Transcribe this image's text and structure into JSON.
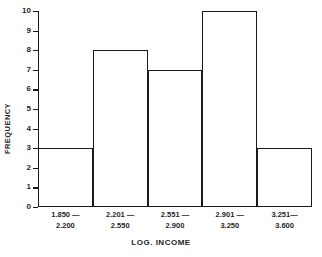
{
  "chart_data": {
    "type": "bar",
    "title": "",
    "xlabel": "LOG. INCOME",
    "ylabel": "FREQUENCY",
    "categories": [
      "1.850 —\n2.200",
      "2.201 —\n2.550",
      "2.551 —\n2.900",
      "2.901 —\n3.250",
      "3.251—\n3.600"
    ],
    "bins": [
      {
        "line1": "1.850 —",
        "line2": "2.200",
        "lower": 1.85,
        "upper": 2.2,
        "value": 3
      },
      {
        "line1": "2.201 —",
        "line2": "2.550",
        "lower": 2.201,
        "upper": 2.55,
        "value": 8
      },
      {
        "line1": "2.551 —",
        "line2": "2.900",
        "lower": 2.551,
        "upper": 2.9,
        "value": 7
      },
      {
        "line1": "2.901 —",
        "line2": "3.250",
        "lower": 2.901,
        "upper": 3.25,
        "value": 10
      },
      {
        "line1": "3.251—",
        "line2": "3.600",
        "lower": 3.251,
        "upper": 3.6,
        "value": 3
      }
    ],
    "values": [
      3,
      8,
      7,
      10,
      3
    ],
    "ylim": [
      0,
      10
    ],
    "ytick_values": [
      0,
      1,
      2,
      3,
      4,
      5,
      6,
      7,
      8,
      9,
      10
    ],
    "ytick_labels": [
      "0",
      "1",
      "2",
      "3",
      "4",
      "5",
      "6",
      "7",
      "8",
      "9",
      "10"
    ],
    "grid": false,
    "legend": false,
    "legend_position": "none",
    "bar_style": "outline",
    "colors": {
      "axis": "#1a1a1a",
      "bar_outline": "#1a1a1a",
      "bar_fill": "transparent",
      "background": "#ffffff",
      "text": "#1f1f1f"
    }
  }
}
